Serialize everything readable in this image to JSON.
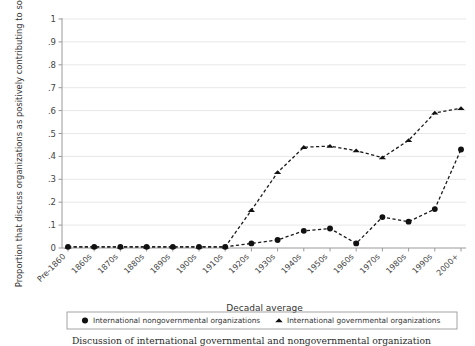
{
  "chart_data": {
    "type": "line",
    "title": "",
    "xlabel": "Decadal average",
    "ylabel": "Proportion that discuss organizations as positively contributing to society",
    "categories": [
      "Pre-1860",
      "1860s",
      "1870s",
      "1880s",
      "1890s",
      "1900s",
      "1910s",
      "1920s",
      "1930s",
      "1940s",
      "1950s",
      "1960s",
      "1970s",
      "1980s",
      "1990s",
      "2000+"
    ],
    "ylim": [
      0,
      1
    ],
    "yticks": [
      "0",
      ".1",
      ".2",
      ".3",
      ".4",
      ".5",
      ".6",
      ".7",
      ".8",
      ".9",
      "1"
    ],
    "ytick_values": [
      0,
      0.1,
      0.2,
      0.3,
      0.4,
      0.5,
      0.6,
      0.7,
      0.8,
      0.9,
      1
    ],
    "grid": true,
    "legend_position": "bottom",
    "series": [
      {
        "name": "International nongovernmental organizations",
        "marker": "circle",
        "linestyle": "dashed",
        "color": "#111111",
        "values": [
          0.005,
          0.005,
          0.005,
          0.005,
          0.005,
          0.005,
          0.005,
          0.02,
          0.035,
          0.075,
          0.085,
          0.02,
          0.135,
          0.115,
          0.17,
          0.43
        ]
      },
      {
        "name": "International governmental organizations",
        "marker": "triangle",
        "linestyle": "dashed",
        "color": "#111111",
        "values": [
          0.005,
          0.005,
          0.005,
          0.005,
          0.005,
          0.005,
          0.005,
          0.165,
          0.33,
          0.44,
          0.445,
          0.425,
          0.395,
          0.47,
          0.59,
          0.61
        ]
      }
    ]
  },
  "legend": {
    "items": [
      {
        "marker": "circle",
        "label": "International nongovernmental organizations"
      },
      {
        "marker": "triangle",
        "label": "International governmental organizations"
      }
    ]
  },
  "caption": {
    "text": "Discussion of international governmental and nongovernmental organization"
  }
}
